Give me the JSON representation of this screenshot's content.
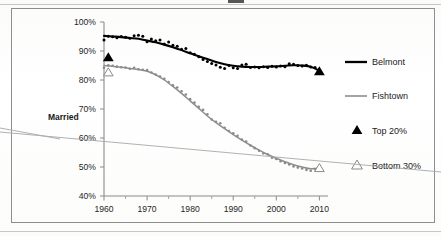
{
  "figure": {
    "kind": "scanned-chart",
    "frame_border_color": "#8e8e8e",
    "background_color": "#ffffff"
  },
  "axis_label": "Married",
  "legend": {
    "items": [
      {
        "label": "Belmont",
        "marker": "thick-line",
        "color": "#000000"
      },
      {
        "label": "Fishtown",
        "marker": "thin-line",
        "color": "#8d8d8d"
      },
      {
        "label": "Top 20%",
        "marker": "filled-triangle",
        "color": "#000000"
      },
      {
        "label": "Bottom 30%",
        "marker": "open-triangle",
        "color": "#8a8a8a"
      }
    ]
  },
  "chart_data": {
    "type": "line",
    "title": "",
    "subtitle": "",
    "xlabel": "",
    "ylabel": "Married",
    "xlim": [
      1960,
      2012
    ],
    "ylim": [
      40,
      100
    ],
    "ytick_labels": [
      "100%",
      "90%",
      "80%",
      "70%",
      "60%",
      "50%",
      "40%"
    ],
    "ytick_values": [
      100,
      90,
      80,
      70,
      60,
      50,
      40
    ],
    "xtick_labels": [
      "1960",
      "1970",
      "1980",
      "1990",
      "2000",
      "2010"
    ],
    "xtick_values": [
      1960,
      1970,
      1980,
      1990,
      2000,
      2010
    ],
    "xminor_tick_values": [
      1965,
      1975,
      1985,
      1995,
      2005
    ],
    "grid": false,
    "legend_position": "right",
    "units": "percent married",
    "series": [
      {
        "name": "Belmont",
        "style": "thick-black-trend-with-scatter",
        "color": "#000000",
        "endpoint_marker": "filled-triangle",
        "x": [
          1960,
          1962,
          1964,
          1966,
          1968,
          1970,
          1972,
          1974,
          1976,
          1978,
          1980,
          1982,
          1984,
          1986,
          1988,
          1990,
          1992,
          1994,
          1996,
          1998,
          2000,
          2002,
          2004,
          2006,
          2008,
          2010
        ],
        "values": [
          95.2,
          95.0,
          94.8,
          94.5,
          94.2,
          93.6,
          93.0,
          92.2,
          91.3,
          90.3,
          89.2,
          88.2,
          87.2,
          86.2,
          85.4,
          84.9,
          84.6,
          84.5,
          84.5,
          84.6,
          84.7,
          84.9,
          85.1,
          85.0,
          84.6,
          83.2
        ],
        "scatter_x": [
          1960,
          1961,
          1962,
          1963,
          1964,
          1965,
          1966,
          1967,
          1968,
          1969,
          1970,
          1971,
          1972,
          1973,
          1974,
          1975,
          1976,
          1977,
          1978,
          1979,
          1980,
          1981,
          1982,
          1983,
          1984,
          1985,
          1986,
          1987,
          1988,
          1989,
          1990,
          1991,
          1992,
          1993,
          1994,
          1995,
          1996,
          1997,
          1998,
          1999,
          2000,
          2001,
          2002,
          2003,
          2004,
          2005,
          2006,
          2007,
          2008,
          2009,
          2010
        ],
        "scatter_values": [
          93.8,
          95.1,
          94.9,
          94.6,
          95.0,
          94.7,
          94.4,
          95.3,
          95.4,
          95.1,
          93.2,
          94.1,
          93.5,
          93.8,
          92.4,
          93.1,
          92.0,
          91.6,
          90.6,
          90.9,
          89.4,
          88.9,
          88.0,
          87.1,
          86.4,
          85.7,
          85.2,
          84.4,
          84.0,
          85.0,
          84.2,
          84.0,
          85.2,
          85.4,
          84.3,
          84.5,
          84.2,
          84.6,
          84.3,
          84.7,
          84.5,
          84.8,
          84.6,
          85.6,
          85.4,
          85.0,
          84.8,
          85.1,
          84.5,
          84.3,
          83.2
        ]
      },
      {
        "name": "Fishtown",
        "style": "thin-gray-trend-with-scatter",
        "color": "#8d8d8d",
        "endpoint_marker": "open-triangle",
        "x": [
          1960,
          1962,
          1964,
          1966,
          1968,
          1970,
          1972,
          1974,
          1976,
          1978,
          1980,
          1982,
          1984,
          1986,
          1988,
          1990,
          1992,
          1994,
          1996,
          1998,
          2000,
          2002,
          2004,
          2006,
          2008,
          2010
        ],
        "values": [
          85.0,
          84.7,
          84.4,
          84.0,
          83.6,
          83.0,
          81.8,
          80.0,
          77.8,
          75.4,
          72.8,
          70.2,
          67.6,
          65.3,
          63.2,
          61.2,
          59.3,
          57.5,
          55.8,
          54.3,
          53.0,
          51.8,
          50.8,
          50.0,
          49.4,
          49.6
        ],
        "scatter_values": [
          84.2,
          85.1,
          84.9,
          84.6,
          84.4,
          84.3,
          83.9,
          84.2,
          83.7,
          83.5,
          83.4,
          82.6,
          81.9,
          81.2,
          80.4,
          79.3,
          78.2,
          77.4,
          76.1,
          75.0,
          73.4,
          72.2,
          70.8,
          69.7,
          68.2,
          66.4,
          65.6,
          65.1,
          63.5,
          62.4,
          61.6,
          60.8,
          59.5,
          58.8,
          57.4,
          56.5,
          55.6,
          54.7,
          54.4,
          53.2,
          52.8,
          52.0,
          51.4,
          50.9,
          50.2,
          49.8,
          49.5,
          49.0,
          48.7,
          49.2,
          49.6
        ],
        "scatter_x": [
          1960,
          1961,
          1962,
          1963,
          1964,
          1965,
          1966,
          1967,
          1968,
          1969,
          1970,
          1971,
          1972,
          1973,
          1974,
          1975,
          1976,
          1977,
          1978,
          1979,
          1980,
          1981,
          1982,
          1983,
          1984,
          1985,
          1986,
          1987,
          1988,
          1989,
          1990,
          1991,
          1992,
          1993,
          1994,
          1995,
          1996,
          1997,
          1998,
          1999,
          2000,
          2001,
          2002,
          2003,
          2004,
          2005,
          2006,
          2007,
          2008,
          2009,
          2010
        ]
      }
    ],
    "annotations": [
      {
        "label": "Top 20%",
        "x": 1961,
        "y": 88.0,
        "marker": "filled-triangle"
      },
      {
        "label": "Bottom 30%",
        "x": 1961,
        "y": 82.8,
        "marker": "open-triangle"
      },
      {
        "label": "Top 20%",
        "x": 2010,
        "y": 83.2,
        "marker": "filled-triangle"
      },
      {
        "label": "Bottom 30%",
        "x": 2010,
        "y": 49.8,
        "marker": "open-triangle"
      }
    ]
  }
}
